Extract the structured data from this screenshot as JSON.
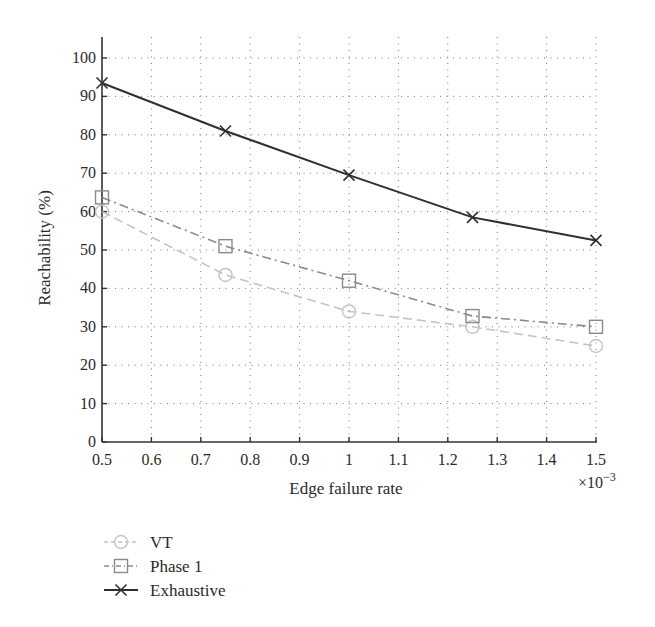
{
  "chart_data": {
    "type": "line",
    "title": "",
    "xlabel": "Edge failure rate",
    "x_multiplier": "×10",
    "x_multiplier_exp": "−3",
    "ylabel": "Reachability (%)",
    "xlim": [
      0.5,
      1.5
    ],
    "ylim": [
      0,
      105
    ],
    "grid": true,
    "legend_position": "below-left",
    "x_ticks": [
      "0.5",
      "0.6",
      "0.7",
      "0.8",
      "0.9",
      "1",
      "1.1",
      "1.2",
      "1.3",
      "1.4",
      "1.5"
    ],
    "y_ticks": [
      "0",
      "10",
      "20",
      "30",
      "40",
      "50",
      "60",
      "70",
      "80",
      "90",
      "100"
    ],
    "x": [
      0.5,
      0.75,
      1.0,
      1.25,
      1.5
    ],
    "series": [
      {
        "name": "VT",
        "marker": "circle",
        "line_style": "dashed",
        "color": "#c4c4c4",
        "values": [
          60,
          43.5,
          34,
          30,
          25
        ]
      },
      {
        "name": "Phase 1",
        "marker": "square",
        "line_style": "dash-dot",
        "color": "#8a8a8a",
        "values": [
          63.7,
          51,
          42,
          32.8,
          30
        ]
      },
      {
        "name": "Exhaustive",
        "marker": "x",
        "line_style": "solid",
        "color": "#2f2f2f",
        "values": [
          93.5,
          81,
          69.5,
          58.5,
          52.5
        ]
      }
    ]
  }
}
